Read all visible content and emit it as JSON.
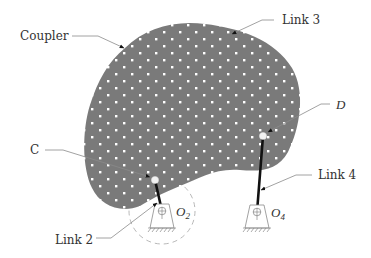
{
  "figure": {
    "colors": {
      "coupler_fill": "#7a7a7a",
      "dot_color": "#ffffff",
      "link_color": "#111111",
      "leader_color": "#8a8a8a",
      "label_color": "#333333",
      "dashed_circle_color": "#b0b0b0"
    },
    "labels": {
      "coupler": "Coupler",
      "link3": "Link 3",
      "point_d": "D",
      "point_c": "C",
      "link4": "Link 4",
      "link2": "Link 2",
      "o2_main": "O",
      "o2_sub": "2",
      "o4_main": "O",
      "o4_sub": "4"
    },
    "points": {
      "C": {
        "x": 155,
        "y": 180
      },
      "D": {
        "x": 263,
        "y": 136
      },
      "O2": {
        "x": 162,
        "y": 211
      },
      "O4": {
        "x": 257,
        "y": 212
      }
    }
  }
}
